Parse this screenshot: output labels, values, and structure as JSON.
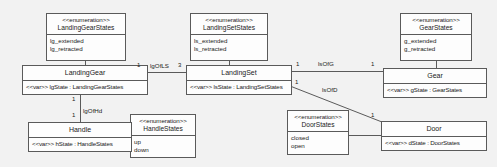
{
  "diagram": {
    "kind": "uml-class-diagram",
    "background_color": "#f2f2f2",
    "box_fill_color": "#fdfdfd",
    "line_color": "#5a5a5a",
    "text_color": "#1a1a1a"
  },
  "enumerations": {
    "landing_gear_states": {
      "stereotype": "<<enumeration>>",
      "name": "LandingGearStates",
      "literals": [
        "lg_extended",
        "lg_retracted"
      ]
    },
    "landing_set_states": {
      "stereotype": "<<enumeration>>",
      "name": "LandingSetStates",
      "literals": [
        "ls_extended",
        "ls_retracted"
      ]
    },
    "gear_states": {
      "stereotype": "<<enumeration>>",
      "name": "GearStates",
      "literals": [
        "g_extended",
        "g_retracted"
      ]
    },
    "handle_states": {
      "stereotype": "<<enumeration>>",
      "name": "HandleStates",
      "literals": [
        "up",
        "down"
      ]
    },
    "door_states": {
      "stereotype": "<<enumeration>>",
      "name": "DoorStates",
      "literals": [
        "closed",
        "open"
      ]
    }
  },
  "classes": {
    "landing_gear": {
      "name": "LandingGear",
      "attributes": [
        "<<var>> lgState : LandingGearStates"
      ]
    },
    "landing_set": {
      "name": "LandingSet",
      "attributes": [
        "<<var>> lsState : LandingSetStates"
      ]
    },
    "gear": {
      "name": "Gear",
      "attributes": [
        "<<var>> gState : GearStates"
      ]
    },
    "handle": {
      "name": "Handle",
      "attributes": [
        "<<var>> hState : HandleStates"
      ]
    },
    "door": {
      "name": "Door",
      "attributes": [
        "<<var>> dState : DoorStates"
      ]
    }
  },
  "associations": {
    "lg_of_ls": {
      "label": "lgOfLS",
      "source_multiplicity": "1",
      "target_multiplicity": "3"
    },
    "ls_of_g": {
      "label": "lsOfG",
      "source_multiplicity": "1",
      "target_multiplicity": "1"
    },
    "ls_of_d": {
      "label": "lsOfD",
      "source_multiplicity": "1",
      "target_multiplicity": "1"
    },
    "lg_of_hd": {
      "label": "lgOfHd",
      "source_multiplicity": "1",
      "target_multiplicity": "1"
    }
  }
}
